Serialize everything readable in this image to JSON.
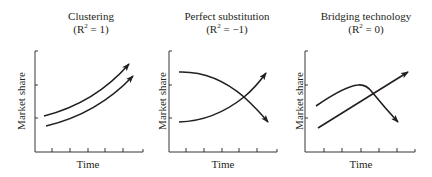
{
  "panels": [
    {
      "title": "Clustering",
      "r2_prefix": "(R",
      "r2_sup": "2",
      "r2_suffix": " = 1)",
      "xlabel": "Time",
      "ylabel": "Market share",
      "description": "Two parallel rising curves"
    },
    {
      "title": "Perfect substitution",
      "r2_prefix": "(R",
      "r2_sup": "2",
      "r2_suffix": " = −1)",
      "xlabel": "Time",
      "ylabel": "Market share",
      "description": "One declining curve and one rising curve crossing"
    },
    {
      "title": "Bridging technology",
      "r2_prefix": "(R",
      "r2_sup": "2",
      "r2_suffix": " = 0)",
      "xlabel": "Time",
      "ylabel": "Market share",
      "description": "Hump-shaped curve crossing a straight rising line"
    }
  ],
  "colors": {
    "line": "#231f20",
    "background": "#ffffff"
  }
}
